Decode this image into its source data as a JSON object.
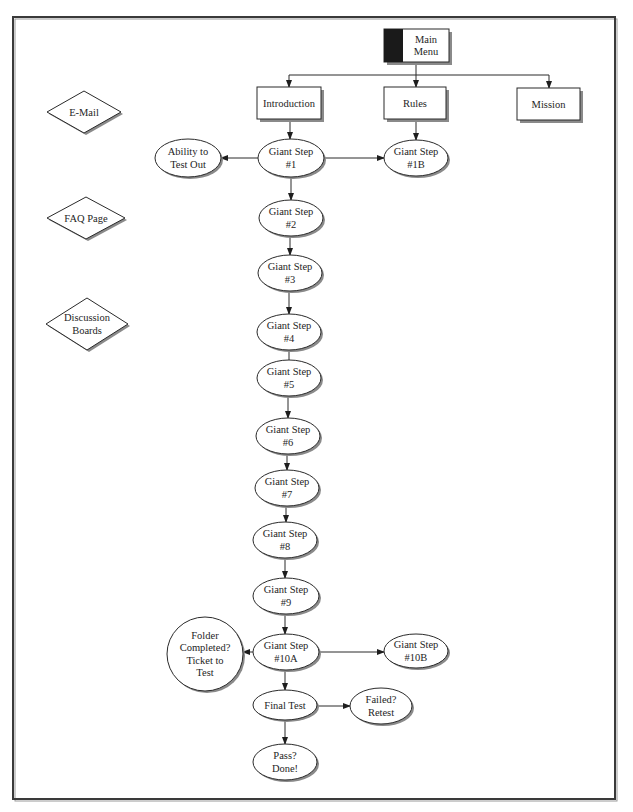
{
  "diagram": {
    "type": "flowchart",
    "nodes": [
      {
        "id": "main_menu",
        "shape": "tabbed-rect",
        "lines": [
          "Main",
          "Menu"
        ],
        "x": 384,
        "y": 29,
        "w": 65,
        "h": 33,
        "tab_w": 19
      },
      {
        "id": "introduction",
        "shape": "rect",
        "lines": [
          "Introduction"
        ],
        "x": 257,
        "y": 87,
        "w": 64,
        "h": 32
      },
      {
        "id": "rules",
        "shape": "rect",
        "lines": [
          "Rules"
        ],
        "x": 384,
        "y": 87,
        "w": 62,
        "h": 32
      },
      {
        "id": "mission",
        "shape": "rect",
        "lines": [
          "Mission"
        ],
        "x": 517,
        "y": 88,
        "w": 63,
        "h": 32
      },
      {
        "id": "email",
        "shape": "diamond",
        "lines": [
          "E-Mail"
        ],
        "cx": 84,
        "cy": 112,
        "rx": 37,
        "ry": 21
      },
      {
        "id": "faq",
        "shape": "diamond",
        "lines": [
          "FAQ Page"
        ],
        "cx": 86,
        "cy": 218,
        "rx": 39,
        "ry": 21
      },
      {
        "id": "discussion",
        "shape": "diamond",
        "lines": [
          "Discussion",
          "Boards"
        ],
        "cx": 87,
        "cy": 324,
        "rx": 41,
        "ry": 26
      },
      {
        "id": "ability",
        "shape": "ellipse",
        "lines": [
          "Ability to",
          "Test Out"
        ],
        "cx": 188,
        "cy": 158,
        "rx": 33,
        "ry": 19
      },
      {
        "id": "step1",
        "shape": "ellipse",
        "lines": [
          "Giant Step",
          "#1"
        ],
        "cx": 291,
        "cy": 158,
        "rx": 33,
        "ry": 19
      },
      {
        "id": "step1b",
        "shape": "ellipse",
        "lines": [
          "Giant Step",
          "#1B"
        ],
        "cx": 416,
        "cy": 158,
        "rx": 32,
        "ry": 18
      },
      {
        "id": "step2",
        "shape": "ellipse",
        "lines": [
          "Giant Step",
          "#2"
        ],
        "cx": 291,
        "cy": 218,
        "rx": 32,
        "ry": 18
      },
      {
        "id": "step3",
        "shape": "ellipse",
        "lines": [
          "Giant Step",
          "#3"
        ],
        "cx": 290,
        "cy": 273,
        "rx": 32,
        "ry": 18
      },
      {
        "id": "step4",
        "shape": "ellipse",
        "lines": [
          "Giant Step",
          "#4"
        ],
        "cx": 289,
        "cy": 332,
        "rx": 32,
        "ry": 18
      },
      {
        "id": "step5",
        "shape": "ellipse",
        "lines": [
          "Giant Step",
          "#5"
        ],
        "cx": 289,
        "cy": 378,
        "rx": 32,
        "ry": 18
      },
      {
        "id": "step6",
        "shape": "ellipse",
        "lines": [
          "Giant Step",
          "#6"
        ],
        "cx": 288,
        "cy": 436,
        "rx": 32,
        "ry": 18
      },
      {
        "id": "step7",
        "shape": "ellipse",
        "lines": [
          "Giant Step",
          "#7"
        ],
        "cx": 287,
        "cy": 488,
        "rx": 32,
        "ry": 18
      },
      {
        "id": "step8",
        "shape": "ellipse",
        "lines": [
          "Giant Step",
          "#8"
        ],
        "cx": 285,
        "cy": 540,
        "rx": 32,
        "ry": 18
      },
      {
        "id": "step9",
        "shape": "ellipse",
        "lines": [
          "Giant Step",
          "#9"
        ],
        "cx": 286,
        "cy": 596,
        "rx": 33,
        "ry": 18
      },
      {
        "id": "step10a",
        "shape": "ellipse",
        "lines": [
          "Giant Step",
          "#10A"
        ],
        "cx": 286,
        "cy": 652,
        "rx": 33,
        "ry": 18
      },
      {
        "id": "folder",
        "shape": "circle",
        "lines": [
          "Folder",
          "Completed?",
          "Ticket to",
          "Test"
        ],
        "cx": 205,
        "cy": 654,
        "rx": 38,
        "ry": 37
      },
      {
        "id": "step10b",
        "shape": "ellipse",
        "lines": [
          "Giant Step",
          "#10B"
        ],
        "cx": 416,
        "cy": 651,
        "rx": 32,
        "ry": 17
      },
      {
        "id": "final_test",
        "shape": "ellipse",
        "lines": [
          "Final Test"
        ],
        "cx": 285,
        "cy": 705,
        "rx": 32,
        "ry": 15
      },
      {
        "id": "failed",
        "shape": "ellipse",
        "lines": [
          "Failed?",
          "Retest"
        ],
        "cx": 381,
        "cy": 706,
        "rx": 31,
        "ry": 18
      },
      {
        "id": "pass",
        "shape": "ellipse",
        "lines": [
          "Pass?",
          "Done!"
        ],
        "cx": 285,
        "cy": 762,
        "rx": 32,
        "ry": 18
      }
    ],
    "edges": [
      {
        "from": "main_menu",
        "points": [
          [
            416,
            62
          ],
          [
            416,
            75
          ]
        ],
        "arrow": false
      },
      {
        "from": "main_menu",
        "points": [
          [
            289,
            75
          ],
          [
            549,
            75
          ]
        ],
        "arrow": false
      },
      {
        "to": "introduction",
        "points": [
          [
            289,
            75
          ],
          [
            289,
            87
          ]
        ],
        "arrow": true
      },
      {
        "to": "rules",
        "points": [
          [
            416,
            75
          ],
          [
            416,
            87
          ]
        ],
        "arrow": true
      },
      {
        "to": "mission",
        "points": [
          [
            549,
            75
          ],
          [
            549,
            88
          ]
        ],
        "arrow": true
      },
      {
        "from": "introduction",
        "to": "step1",
        "points": [
          [
            290,
            119
          ],
          [
            290,
            139
          ]
        ],
        "arrow": true
      },
      {
        "from": "rules",
        "to": "step1b",
        "points": [
          [
            416,
            119
          ],
          [
            416,
            140
          ]
        ],
        "arrow": true
      },
      {
        "from": "step1",
        "to": "ability",
        "points": [
          [
            258,
            158
          ],
          [
            221,
            158
          ]
        ],
        "arrow": true
      },
      {
        "from": "step1",
        "to": "step1b",
        "points": [
          [
            324,
            158
          ],
          [
            384,
            158
          ]
        ],
        "arrow": true
      },
      {
        "from": "step1",
        "to": "step2",
        "points": [
          [
            291,
            177
          ],
          [
            291,
            200
          ]
        ],
        "arrow": true
      },
      {
        "from": "step2",
        "to": "step3",
        "points": [
          [
            290,
            236
          ],
          [
            290,
            255
          ]
        ],
        "arrow": true
      },
      {
        "from": "step3",
        "to": "step4",
        "points": [
          [
            289,
            291
          ],
          [
            289,
            314
          ]
        ],
        "arrow": true
      },
      {
        "from": "step4",
        "to": "step5",
        "points": [
          [
            289,
            350
          ],
          [
            289,
            360
          ]
        ],
        "arrow": false
      },
      {
        "from": "step5",
        "to": "step6",
        "points": [
          [
            288,
            396
          ],
          [
            288,
            418
          ]
        ],
        "arrow": true
      },
      {
        "from": "step6",
        "to": "step7",
        "points": [
          [
            287,
            454
          ],
          [
            287,
            470
          ]
        ],
        "arrow": true
      },
      {
        "from": "step7",
        "to": "step8",
        "points": [
          [
            286,
            506
          ],
          [
            286,
            522
          ]
        ],
        "arrow": true
      },
      {
        "from": "step8",
        "to": "step9",
        "points": [
          [
            285,
            558
          ],
          [
            285,
            578
          ]
        ],
        "arrow": true
      },
      {
        "from": "step9",
        "to": "step10a",
        "points": [
          [
            285,
            614
          ],
          [
            285,
            634
          ]
        ],
        "arrow": true
      },
      {
        "from": "step10a",
        "to": "folder",
        "points": [
          [
            253,
            652
          ],
          [
            243,
            652
          ]
        ],
        "arrow": true
      },
      {
        "from": "step10a",
        "to": "step10b",
        "points": [
          [
            319,
            652
          ],
          [
            384,
            652
          ]
        ],
        "arrow": true
      },
      {
        "from": "step10a",
        "to": "final_test",
        "points": [
          [
            285,
            670
          ],
          [
            285,
            690
          ]
        ],
        "arrow": true
      },
      {
        "from": "final_test",
        "to": "failed",
        "points": [
          [
            317,
            706
          ],
          [
            350,
            706
          ]
        ],
        "arrow": true
      },
      {
        "from": "final_test",
        "to": "pass",
        "points": [
          [
            285,
            720
          ],
          [
            285,
            744
          ]
        ],
        "arrow": true
      }
    ]
  },
  "frame": {
    "x": 13,
    "y": 17,
    "w": 602,
    "h": 782
  },
  "colors": {
    "stroke": "#2a2a2a",
    "shadow": "#8a8a8a",
    "tab": "#1a1a1a",
    "background": "#ffffff"
  }
}
